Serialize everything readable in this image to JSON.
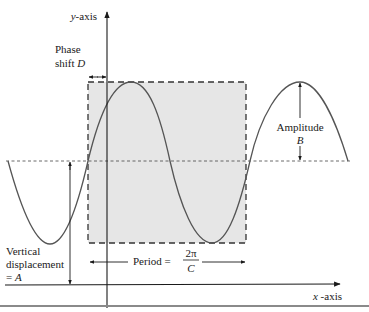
{
  "diagram": {
    "axes": {
      "y_label": "y-axis",
      "x_label_var": "x",
      "x_label_rest": " -axis"
    },
    "annotations": {
      "phase_shift_line1": "Phase",
      "phase_shift_line2_prefix": "shift ",
      "phase_shift_var": "D",
      "amplitude_label": "Amplitude",
      "amplitude_var": "B",
      "vertical_line1": "Vertical",
      "vertical_line2": "displacement",
      "vertical_line3_prefix": "= ",
      "vertical_var": "A",
      "period_label": "Period =",
      "period_numerator": "2π",
      "period_denominator": "C"
    },
    "colors": {
      "curve": "#555555",
      "shaded_box": "#e6e6e6",
      "axis": "#1a1a1a",
      "dashed_line": "#333333"
    }
  }
}
